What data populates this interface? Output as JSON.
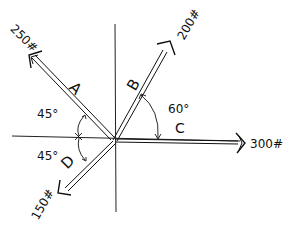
{
  "diagram": {
    "type": "force-vector-diagram",
    "origin": {
      "x": 113,
      "y": 140
    },
    "axes": {
      "horizontal": {
        "x1": 12,
        "x2": 250,
        "y": 138
      },
      "vertical": {
        "x": 115,
        "y1": 24,
        "y2": 212
      }
    },
    "vectors": [
      {
        "id": "A",
        "label": "A",
        "magnitude": "250#",
        "angle_desc": "45° above negative x-axis",
        "tip": {
          "x": 30,
          "y": 56
        }
      },
      {
        "id": "B",
        "label": "B",
        "magnitude": "200#",
        "angle_desc": "60° above positive x-axis",
        "tip": {
          "x": 170,
          "y": 42
        }
      },
      {
        "id": "C",
        "label": "C",
        "magnitude": "300#",
        "angle_desc": "along positive x-axis",
        "tip": {
          "x": 243,
          "y": 143
        }
      },
      {
        "id": "D",
        "label": "D",
        "magnitude": "150#",
        "angle_desc": "45° below negative x-axis",
        "tip": {
          "x": 60,
          "y": 192
        }
      }
    ],
    "angles": [
      {
        "label": "45°",
        "between": "A and -x axis"
      },
      {
        "label": "45°",
        "between": "D and -x axis"
      },
      {
        "label": "60°",
        "between": "B and C"
      }
    ],
    "stroke_color": "#111111",
    "background": "#ffffff"
  }
}
